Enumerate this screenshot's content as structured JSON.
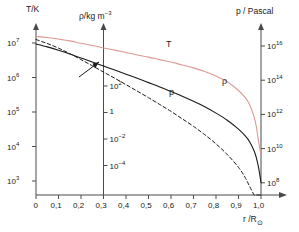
{
  "figure": {
    "axis_titles": {
      "left": "T/K",
      "middle_rho": "ρ",
      "middle_unit": "/kg m",
      "middle_exp": "−3",
      "right": "p / Pascal",
      "xaxis": "r /R",
      "xaxis_sun": "⊙"
    },
    "curve_labels": {
      "temperature": "T",
      "density": "ρ",
      "pressure": "p"
    },
    "colors": {
      "temperature": "#dc9a96",
      "density": "#1a1a1a",
      "pressure": "#1a1a1a",
      "axis": "#4a4a4a",
      "text": "#1a1a1a",
      "background": "#ffffff"
    },
    "annotation": {
      "arrow": "arrow-pointing-to-axis-crossing"
    }
  },
  "chart_data": {
    "type": "line",
    "title": "",
    "xlabel": "r /R⊙",
    "xlim": [
      0,
      1.06
    ],
    "x_tick_labels": [
      "0",
      "0,1",
      "0,2",
      "0,3",
      "0,4",
      "0,5",
      "0,6",
      "0,7",
      "0,8",
      "0,9",
      "1,0"
    ],
    "x_tick_values": [
      0,
      0.1,
      0.2,
      0.3,
      0.4,
      0.5,
      0.6,
      0.7,
      0.8,
      0.9,
      1.0
    ],
    "grid": false,
    "legend": "inline-curve-labels",
    "axes": [
      {
        "name": "left-temperature-axis",
        "position": "x=0",
        "label": "T/K",
        "scale": "log",
        "tick_labels": [
          "10",
          "10",
          "10",
          "10",
          "10"
        ],
        "tick_exponents": [
          "7",
          "6",
          "5",
          "4",
          "3"
        ],
        "tick_values": [
          10000000.0,
          1000000.0,
          100000.0,
          10000.0,
          1000.0
        ]
      },
      {
        "name": "middle-density-axis",
        "position": "x=0.3",
        "label": "ρ /kg m−3",
        "scale": "log",
        "tick_labels": [
          "10",
          "1",
          "10",
          "10"
        ],
        "tick_exponents": [
          "2",
          "",
          "−2",
          "−4"
        ],
        "tick_values": [
          100,
          1,
          0.01,
          0.0001
        ]
      },
      {
        "name": "right-pressure-axis",
        "position": "x=1.0",
        "label": "p / Pascal",
        "scale": "log",
        "tick_labels": [
          "10",
          "10",
          "10",
          "10",
          "10"
        ],
        "tick_exponents": [
          "16",
          "14",
          "12",
          "10",
          "8"
        ],
        "tick_values": [
          1e+16,
          100000000000000.0,
          1000000000000.0,
          10000000000.0,
          100000000.0
        ]
      }
    ],
    "series": [
      {
        "name": "T",
        "label": "T",
        "style": "solid",
        "color": "#dc9a96",
        "axis": "left-temperature-axis",
        "x": [
          0.0,
          0.05,
          0.1,
          0.15,
          0.2,
          0.25,
          0.3,
          0.35,
          0.4,
          0.45,
          0.5,
          0.55,
          0.6,
          0.65,
          0.7,
          0.75,
          0.8,
          0.85,
          0.9,
          0.93,
          0.95,
          0.97,
          0.98,
          0.99,
          1.0
        ],
        "y": [
          15500000.0,
          14500000.0,
          13000000.0,
          11500000.0,
          9800000.0,
          8500000.0,
          7200000.0,
          6200000.0,
          5300000.0,
          4500000.0,
          3900000.0,
          3300000.0,
          2800000.0,
          2300000.0,
          1900000.0,
          1500000.0,
          1100000.0,
          750000.0,
          420000.0,
          260000.0,
          160000.0,
          70000.0,
          35000.0,
          13000.0,
          5800.0
        ]
      },
      {
        "name": "rho",
        "label": "ρ",
        "style": "solid",
        "color": "#1a1a1a",
        "axis": "middle-density-axis",
        "x": [
          0.0,
          0.05,
          0.1,
          0.15,
          0.2,
          0.25,
          0.3,
          0.35,
          0.4,
          0.45,
          0.5,
          0.55,
          0.6,
          0.65,
          0.7,
          0.75,
          0.8,
          0.85,
          0.9,
          0.93,
          0.95,
          0.97,
          0.98,
          0.99,
          1.0
        ],
        "y": [
          150000.0,
          90000.0,
          50000.0,
          26000.0,
          13000.0,
          6500.0,
          3200.0,
          1600.0,
          780.0,
          380.0,
          180.0,
          85.0,
          38.0,
          17.0,
          7.0,
          2.7,
          0.9,
          0.26,
          0.055,
          0.017,
          0.006,
          0.0012,
          0.00035,
          6e-05,
          5e-06
        ]
      },
      {
        "name": "p",
        "label": "p",
        "style": "dashed",
        "color": "#1a1a1a",
        "axis": "right-pressure-axis",
        "x": [
          0.0,
          0.05,
          0.1,
          0.15,
          0.2,
          0.25,
          0.3,
          0.35,
          0.4,
          0.45,
          0.5,
          0.55,
          0.6,
          0.65,
          0.7,
          0.75,
          0.8,
          0.85,
          0.9,
          0.93,
          0.95,
          0.97,
          0.98,
          0.99,
          1.0
        ],
        "y": [
          2.4e+16,
          1.4e+16,
          7500000000000000.0,
          3600000000000000.0,
          1600000000000000.0,
          700000000000000.0,
          300000000000000.0,
          130000000000000.0,
          55000000000000.0,
          23000000000000.0,
          9500000000000.0,
          3800000000000.0,
          1500000000000.0,
          550000000000.0,
          200000000000.0,
          65000000000.0,
          19000000000.0,
          4500000000.0,
          800000000.0,
          200000000.0,
          60000000.0,
          10000000.0,
          3000000.0,
          400000.0,
          20000.0
        ]
      }
    ]
  }
}
